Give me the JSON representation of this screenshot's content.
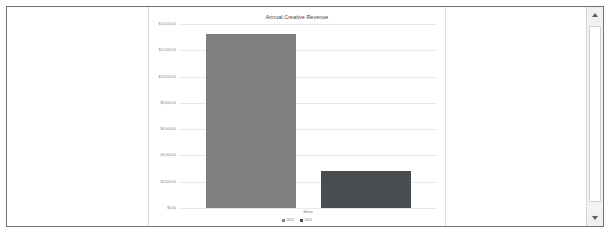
{
  "window": {
    "scrollbar": {
      "up_arrow": "scroll-up",
      "down_arrow": "scroll-down"
    }
  },
  "chart_data": {
    "type": "bar",
    "title": "Annual Creative Revenue",
    "xlabel": "Series",
    "ylabel": "",
    "categories": [
      "Series"
    ],
    "series": [
      {
        "name": "2022",
        "color": "#808080",
        "values": [
          13250.0
        ]
      },
      {
        "name": "2021",
        "color": "#494d50",
        "values": [
          2850.0
        ]
      }
    ],
    "ylim": [
      0,
      14000
    ],
    "yticks": [
      {
        "value": 14000,
        "label": "$14,000.00"
      },
      {
        "value": 12000,
        "label": "$12,000.00"
      },
      {
        "value": 10000,
        "label": "$10,000.00"
      },
      {
        "value": 8000,
        "label": "$8,000.00"
      },
      {
        "value": 6000,
        "label": "$6,000.00"
      },
      {
        "value": 4000,
        "label": "$4,000.00"
      },
      {
        "value": 2000,
        "label": "$2,000.00"
      },
      {
        "value": 0,
        "label": "$0.00"
      }
    ],
    "grid": true,
    "legend_position": "bottom"
  }
}
